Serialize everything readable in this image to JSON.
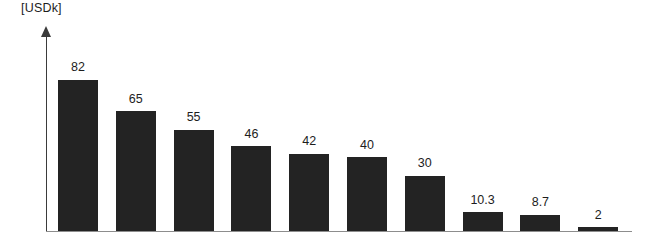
{
  "chart": {
    "unit_label": "[USDk]",
    "bar_color": "#232323",
    "axis_color": "#3b3b3b",
    "baseline_color": "#8d8d8d",
    "label_color": "#1d1d1d"
  },
  "chart_data": {
    "type": "bar",
    "title": "",
    "subtitle": "",
    "xlabel": "",
    "ylabel": "[USDk]",
    "categories": [
      "1",
      "2",
      "3",
      "4",
      "5",
      "6",
      "7",
      "8",
      "9",
      "10"
    ],
    "values": [
      82,
      65,
      55,
      46,
      42,
      40,
      30,
      10.3,
      8.7,
      2
    ],
    "labels": [
      "82",
      "65",
      "55",
      "46",
      "42",
      "40",
      "30",
      "10.3",
      "8.7",
      "2"
    ],
    "ylim": [
      0,
      108
    ],
    "grid": false,
    "legend": null,
    "tick_labels_x": [],
    "tick_labels_y": [],
    "annotations": [
      "[USDk]"
    ]
  }
}
